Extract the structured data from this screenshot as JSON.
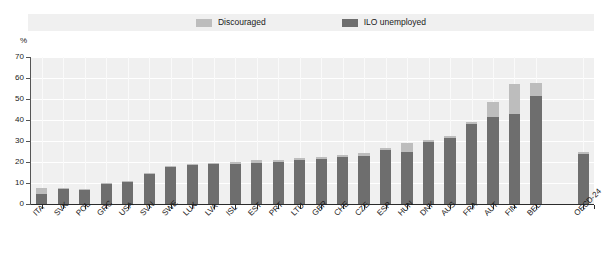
{
  "chart_data": {
    "type": "bar",
    "stacked": true,
    "title": "",
    "subtitle": "",
    "xlabel": "",
    "ylabel": "%",
    "ylim": [
      0,
      70
    ],
    "yticks": [
      0,
      10,
      20,
      30,
      40,
      50,
      60,
      70
    ],
    "ytick_labels": [
      "0",
      "10",
      "20",
      "30",
      "40",
      "50",
      "60",
      "70"
    ],
    "grid": true,
    "legend_position": "top",
    "categories": [
      "ITA",
      "SVK",
      "POL",
      "GRC",
      "USA",
      "SVN",
      "SWE",
      "LUX",
      "LVA",
      "ISL",
      "EST",
      "PRT",
      "LTU",
      "GBR",
      "CHE",
      "CZE",
      "ESP",
      "HUN",
      "DNK",
      "AUS",
      "FRA",
      "AUT",
      "FIN",
      "BEL",
      "OECD-24"
    ],
    "series": [
      {
        "name": "ILO unemployed",
        "color": "#6e6e6e",
        "values": [
          5.0,
          7.0,
          6.5,
          9.5,
          10.5,
          14.5,
          17.5,
          18.5,
          19.0,
          19.0,
          19.5,
          20.0,
          21.0,
          21.5,
          22.5,
          23.0,
          25.5,
          25.0,
          29.5,
          31.5,
          38.0,
          41.5,
          43.0,
          51.5,
          24.0
        ]
      },
      {
        "name": "Discouraged",
        "color": "#bdbdbd",
        "values": [
          2.5,
          0.5,
          0.5,
          0.5,
          0.5,
          0.5,
          0.5,
          0.5,
          0.5,
          1.0,
          1.5,
          1.0,
          1.0,
          1.0,
          1.0,
          1.5,
          1.0,
          4.0,
          1.0,
          1.0,
          1.0,
          7.0,
          14.0,
          6.0,
          1.0
        ]
      }
    ],
    "totals": [
      7.5,
      7.5,
      7.0,
      10.0,
      11.0,
      15.0,
      18.0,
      19.0,
      19.5,
      20.0,
      21.0,
      21.0,
      22.0,
      22.5,
      23.5,
      24.5,
      26.5,
      29.0,
      30.5,
      32.5,
      39.0,
      48.5,
      57.0,
      57.5,
      25.0
    ],
    "gap_before_last": true
  },
  "legend": {
    "entries": [
      {
        "label": "Discouraged",
        "color": "#bdbdbd",
        "swatch_name": "legend-swatch-discouraged"
      },
      {
        "label": "ILO unemployed",
        "color": "#6e6e6e",
        "swatch_name": "legend-swatch-ilo-unemployed"
      }
    ]
  },
  "axis": {
    "y_unit": "%"
  },
  "colors": {
    "plot_background": "#f0f0f0",
    "page_background": "#ffffff",
    "gridline": "#ffffff",
    "axis": "#555555",
    "text": "#1a1a1a",
    "discouraged": "#bdbdbd",
    "ilo_unemployed": "#6e6e6e"
  }
}
